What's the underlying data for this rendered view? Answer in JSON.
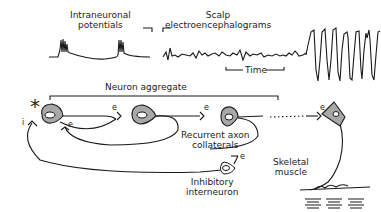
{
  "labels": {
    "intraneuronal": [
      "Intraneuronal",
      "potentials"
    ],
    "scalp": [
      "Scalp",
      "electroencephalograms"
    ],
    "time": "Time",
    "aggregate": "Neuron aggregate",
    "recurrent": [
      "Recurrent axon",
      "collaterals"
    ],
    "inhibitory": [
      "Inhibitory",
      "interneuron"
    ],
    "skeletal": [
      "Skeletal",
      "muscle"
    ],
    "excitatory_mark": "e",
    "inhibitory_mark": "i",
    "asterisk": "*"
  },
  "colors": {
    "line": "#1a1a1a",
    "cell_fill": "#a8a8a8"
  }
}
